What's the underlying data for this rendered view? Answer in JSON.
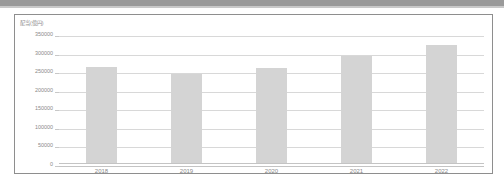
{
  "page": {
    "background_color": "#ffffff",
    "top_strip_color": "#9a9a9a"
  },
  "chart_card": {
    "border_color": "#8e8e8e",
    "background_color": "#ffffff"
  },
  "chart_data": {
    "type": "bar",
    "title": "",
    "subtitle": "",
    "xlabel": "",
    "ylabel": "配当(億円)",
    "categories": [
      "2018",
      "2019",
      "2020",
      "2021",
      "2022"
    ],
    "values": [
      262000,
      243000,
      259000,
      292000,
      320000
    ],
    "series": [
      {
        "name": "配当(億円)",
        "values": [
          262000,
          243000,
          259000,
          292000,
          320000
        ]
      }
    ],
    "ylim": [
      0,
      350000
    ],
    "ytick_labels": [
      "0",
      "50000",
      "100000",
      "150000",
      "200000",
      "250000",
      "300000",
      "350000"
    ],
    "ytick_values": [
      0,
      50000,
      100000,
      150000,
      200000,
      250000,
      300000,
      350000
    ],
    "xtick_labels": [
      "2018",
      "2019",
      "2020",
      "2021",
      "2022"
    ],
    "grid": true,
    "grid_axis": "y",
    "grid_color": "#d8d8d8",
    "legend": false,
    "legend_position": "none",
    "bar_color": "#d4d4d4",
    "axis_text_color": "#8a8a8a",
    "annotations": []
  }
}
